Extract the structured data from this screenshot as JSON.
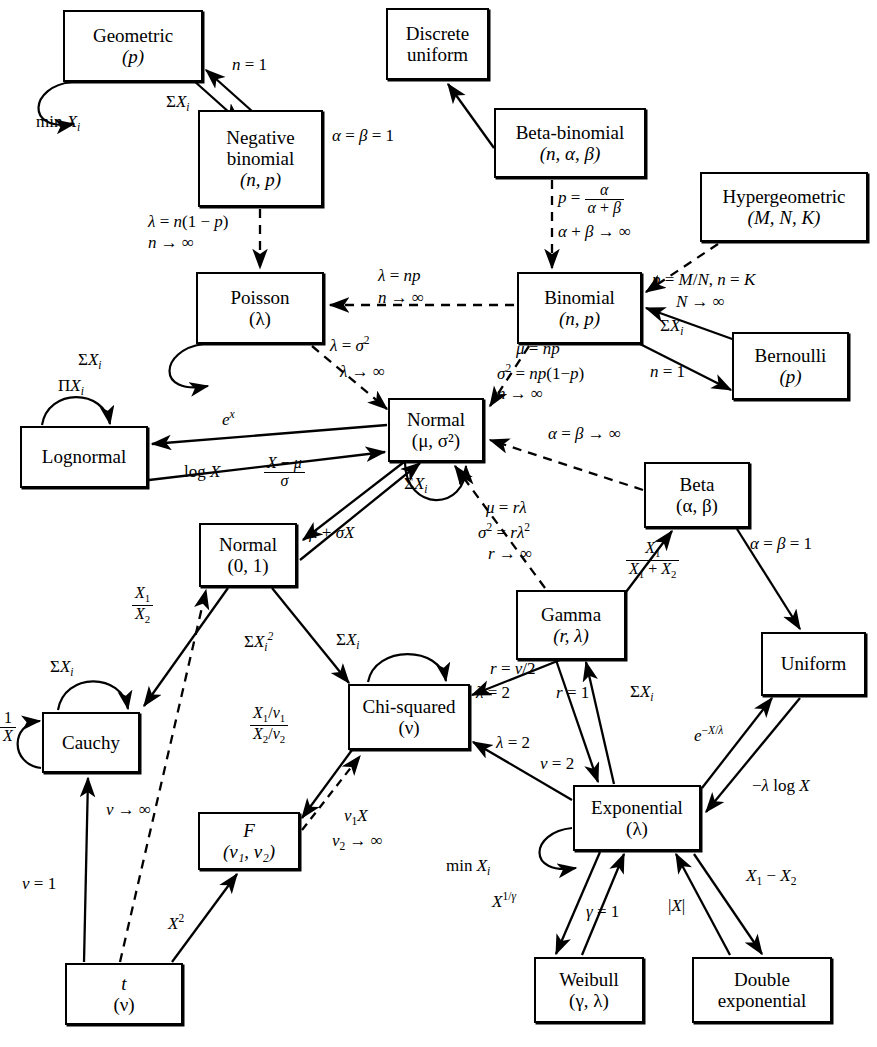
{
  "figure": {
    "type": "relationship-diagram",
    "legend": {
      "solid_arrow": "exact transformation / special case",
      "dashed_arrow": "limiting (asymptotic) relationship"
    }
  },
  "nodes": [
    {
      "id": "geometric",
      "name": "Geometric",
      "params": "(p)",
      "x": 63,
      "y": 10,
      "w": 140,
      "h": 72
    },
    {
      "id": "negative-binomial",
      "name": "Negative",
      "name2": "binomial",
      "params": "(n, p)",
      "x": 198,
      "y": 110,
      "w": 125,
      "h": 97
    },
    {
      "id": "discrete-uniform",
      "name": "Discrete",
      "name2": "uniform",
      "params": "",
      "x": 386,
      "y": 8,
      "w": 103,
      "h": 72
    },
    {
      "id": "beta-binomial",
      "name": "Beta-binomial",
      "params": "(n, α, β)",
      "x": 494,
      "y": 108,
      "w": 152,
      "h": 70
    },
    {
      "id": "hypergeometric",
      "name": "Hypergeometric",
      "params": "(M, N, K)",
      "x": 700,
      "y": 172,
      "w": 168,
      "h": 70
    },
    {
      "id": "poisson",
      "name": "Poisson",
      "params": "(λ)",
      "x": 196,
      "y": 272,
      "w": 128,
      "h": 72
    },
    {
      "id": "binomial",
      "name": "Binomial",
      "params": "(n, p)",
      "x": 517,
      "y": 272,
      "w": 125,
      "h": 72
    },
    {
      "id": "bernoulli",
      "name": "Bernoulli",
      "params": "(p)",
      "x": 732,
      "y": 332,
      "w": 117,
      "h": 68
    },
    {
      "id": "normal-mu-sigma",
      "name": "Normal",
      "params": "(μ, σ²)",
      "x": 388,
      "y": 398,
      "w": 96,
      "h": 64
    },
    {
      "id": "lognormal",
      "name": "Lognormal",
      "params": "",
      "x": 20,
      "y": 426,
      "w": 128,
      "h": 62
    },
    {
      "id": "normal-01",
      "name": "Normal",
      "params": "(0, 1)",
      "x": 199,
      "y": 523,
      "w": 98,
      "h": 64
    },
    {
      "id": "beta",
      "name": "Beta",
      "params": "(α, β)",
      "x": 644,
      "y": 462,
      "w": 106,
      "h": 66
    },
    {
      "id": "gamma",
      "name": "Gamma",
      "params": "(r, λ)",
      "x": 516,
      "y": 590,
      "w": 110,
      "h": 70
    },
    {
      "id": "uniform",
      "name": "Uniform",
      "params": "",
      "x": 761,
      "y": 632,
      "w": 105,
      "h": 64
    },
    {
      "id": "cauchy",
      "name": "Cauchy",
      "params": "",
      "x": 42,
      "y": 712,
      "w": 98,
      "h": 61
    },
    {
      "id": "chi-squared",
      "name": "Chi-squared",
      "params": "(ν)",
      "x": 348,
      "y": 684,
      "w": 122,
      "h": 66
    },
    {
      "id": "exponential",
      "name": "Exponential",
      "params": "(λ)",
      "x": 573,
      "y": 785,
      "w": 128,
      "h": 66
    },
    {
      "id": "f",
      "name": "F",
      "params": "(ν₁, ν₂)",
      "x": 198,
      "y": 812,
      "w": 102,
      "h": 58
    },
    {
      "id": "t",
      "name": "t",
      "params": "(ν)",
      "x": 65,
      "y": 963,
      "w": 118,
      "h": 62
    },
    {
      "id": "weibull",
      "name": "Weibull",
      "params": "(γ, λ)",
      "x": 534,
      "y": 957,
      "w": 110,
      "h": 66
    },
    {
      "id": "double-exponential",
      "name": "Double",
      "name2": "exponential",
      "params": "",
      "x": 692,
      "y": 957,
      "w": 140,
      "h": 66
    }
  ],
  "edge_labels": [
    {
      "id": "geom-self",
      "text": "min X",
      "sub": "i",
      "x": 36,
      "y": 112
    },
    {
      "id": "nb-to-geom",
      "text": "n = 1",
      "x": 232,
      "y": 62
    },
    {
      "id": "geom-to-nb",
      "text": "ΣX",
      "sub": "i",
      "x": 168,
      "y": 98
    },
    {
      "id": "betabin-to-du",
      "text": "α = β = 1",
      "x": 339,
      "y": 126
    },
    {
      "id": "nb-to-poisson-1",
      "text": "λ = n(1 − p)",
      "x": 152,
      "y": 219
    },
    {
      "id": "nb-to-poisson-2",
      "text": "n → ∞",
      "x": 152,
      "y": 240
    },
    {
      "id": "betabin-to-binom-1",
      "text": "p = α/(α+β)",
      "x": 561,
      "y": 188
    },
    {
      "id": "betabin-to-binom-2",
      "text": "α + β → ∞",
      "x": 555,
      "y": 228
    },
    {
      "id": "hyper-to-binom-1",
      "text": "p = M/N, n = K",
      "x": 654,
      "y": 276
    },
    {
      "id": "hyper-to-binom-2",
      "text": "N → ∞",
      "x": 676,
      "y": 298
    },
    {
      "id": "binom-to-poisson-1",
      "text": "λ = np",
      "x": 380,
      "y": 273
    },
    {
      "id": "binom-to-poisson-2",
      "text": "n → ∞",
      "x": 378,
      "y": 294
    },
    {
      "id": "poisson-self",
      "text": "ΣX",
      "sub": "i",
      "x": 79,
      "y": 352
    },
    {
      "id": "poisson-to-normal-1",
      "text": "λ = σ²",
      "x": 335,
      "y": 341
    },
    {
      "id": "poisson-to-normal-2",
      "text": "λ → ∞",
      "x": 343,
      "y": 369
    },
    {
      "id": "binom-to-normal-1",
      "text": "μ = np",
      "x": 519,
      "y": 345
    },
    {
      "id": "binom-to-normal-2",
      "text": "σ² = np(1 − p)",
      "x": 500,
      "y": 369
    },
    {
      "id": "binom-to-normal-3",
      "text": "n → ∞",
      "x": 500,
      "y": 391
    },
    {
      "id": "bernoulli-to-binom",
      "text": "ΣX",
      "sub": "i",
      "x": 662,
      "y": 323
    },
    {
      "id": "binom-to-bernoulli",
      "text": "n = 1",
      "x": 653,
      "y": 368
    },
    {
      "id": "lognormal-self",
      "text": "ΠX",
      "sub": "i",
      "x": 60,
      "y": 379
    },
    {
      "id": "normal-to-lognormal",
      "text": "eˣ",
      "x": 226,
      "y": 416
    },
    {
      "id": "lognormal-to-normal",
      "text": "log X",
      "x": 188,
      "y": 468
    },
    {
      "id": "normal-to-n01",
      "text": "(X − μ)/σ",
      "x": 272,
      "y": 466
    },
    {
      "id": "n01-to-normal",
      "text": "μ + σX",
      "x": 313,
      "y": 530
    },
    {
      "id": "normal-self",
      "text": "ΣX",
      "sub": "i",
      "x": 406,
      "y": 481
    },
    {
      "id": "beta-to-normal",
      "text": "α = β → ∞",
      "x": 552,
      "y": 430
    },
    {
      "id": "gamma-to-normal-1",
      "text": "μ = rλ",
      "x": 488,
      "y": 505
    },
    {
      "id": "gamma-to-normal-2",
      "text": "σ² = rλ²",
      "x": 482,
      "y": 528
    },
    {
      "id": "gamma-to-normal-3",
      "text": "r → ∞",
      "x": 490,
      "y": 550
    },
    {
      "id": "gamma-to-beta",
      "text": "X₁/(X₁ + X₂)",
      "x": 630,
      "y": 550
    },
    {
      "id": "beta-to-uniform",
      "text": "α = β = 1",
      "x": 757,
      "y": 540
    },
    {
      "id": "n01-to-cauchy",
      "text": "X₁/X₂",
      "x": 135,
      "y": 592
    },
    {
      "id": "cauchy-self-top",
      "text": "ΣX",
      "sub": "i",
      "x": 52,
      "y": 663
    },
    {
      "id": "cauchy-self-left",
      "text": "1/X",
      "x": 0,
      "y": 718
    },
    {
      "id": "n01-to-chisq",
      "text": "ΣX²",
      "sub": "i",
      "x": 249,
      "y": 636
    },
    {
      "id": "chisq-self",
      "text": "ΣX",
      "sub": "i",
      "x": 338,
      "y": 636
    },
    {
      "id": "chisq-to-f",
      "text": "(X₁/ν₁)/(X₂/ν₂)",
      "x": 257,
      "y": 718
    },
    {
      "id": "f-to-chisq-1",
      "text": "ν₁X",
      "x": 348,
      "y": 813
    },
    {
      "id": "f-to-chisq-2",
      "text": "ν₂ → ∞",
      "x": 337,
      "y": 838
    },
    {
      "id": "chisq-to-gamma-1",
      "text": "r = ν/2",
      "x": 495,
      "y": 665
    },
    {
      "id": "chisq-to-gamma-2",
      "text": "λ = 2",
      "x": 481,
      "y": 690
    },
    {
      "id": "gamma-to-exp",
      "text": "r = 1",
      "x": 561,
      "y": 690
    },
    {
      "id": "exp-to-gamma",
      "text": "ΣX",
      "sub": "i",
      "x": 634,
      "y": 689
    },
    {
      "id": "chisq-to-exp-1",
      "text": "λ = 2",
      "x": 500,
      "y": 740
    },
    {
      "id": "chisq-to-exp-2",
      "text": "ν = 2",
      "x": 545,
      "y": 760
    },
    {
      "id": "exp-to-uniform",
      "text": "e⁻ˣᐟλ",
      "x": 700,
      "y": 732
    },
    {
      "id": "uniform-to-exp",
      "text": "−λ log X",
      "x": 758,
      "y": 783
    },
    {
      "id": "exp-self",
      "text": "min X",
      "sub": "i",
      "x": 449,
      "y": 862
    },
    {
      "id": "exp-to-weibull",
      "text": "X¹ᐟᵞ",
      "x": 497,
      "y": 898
    },
    {
      "id": "weibull-to-exp",
      "text": "γ = 1",
      "x": 592,
      "y": 908
    },
    {
      "id": "de-to-exp",
      "text": "|X|",
      "x": 672,
      "y": 902
    },
    {
      "id": "exp-to-de",
      "text": "X₁ − X₂",
      "x": 752,
      "y": 872
    },
    {
      "id": "t-to-cauchy",
      "text": "ν = 1",
      "x": 25,
      "y": 880
    },
    {
      "id": "t-to-n01",
      "text": "ν → ∞",
      "x": 110,
      "y": 806
    },
    {
      "id": "t-to-f",
      "text": "X²",
      "x": 172,
      "y": 920
    }
  ],
  "edges": [
    {
      "from": "negative-binomial",
      "to": "geometric",
      "style": "solid",
      "label": "n = 1"
    },
    {
      "from": "geometric",
      "to": "negative-binomial",
      "style": "solid",
      "label": "ΣX_i"
    },
    {
      "from": "geometric",
      "to": "geometric",
      "style": "solid",
      "label": "min X_i"
    },
    {
      "from": "beta-binomial",
      "to": "discrete-uniform",
      "style": "solid",
      "label": "α = β = 1"
    },
    {
      "from": "negative-binomial",
      "to": "poisson",
      "style": "dashed",
      "label": "λ = n(1 − p), n → ∞"
    },
    {
      "from": "beta-binomial",
      "to": "binomial",
      "style": "dashed",
      "label": "p = α/(α+β), α + β → ∞"
    },
    {
      "from": "hypergeometric",
      "to": "binomial",
      "style": "dashed",
      "label": "p = M/N, n = K, N → ∞"
    },
    {
      "from": "binomial",
      "to": "poisson",
      "style": "dashed",
      "label": "λ = np, n → ∞"
    },
    {
      "from": "poisson",
      "to": "poisson",
      "style": "solid",
      "label": "ΣX_i"
    },
    {
      "from": "poisson",
      "to": "normal-mu-sigma",
      "style": "dashed",
      "label": "λ = σ², λ → ∞"
    },
    {
      "from": "binomial",
      "to": "normal-mu-sigma",
      "style": "dashed",
      "label": "μ = np, σ² = np(1−p), n → ∞"
    },
    {
      "from": "bernoulli",
      "to": "binomial",
      "style": "solid",
      "label": "ΣX_i"
    },
    {
      "from": "binomial",
      "to": "bernoulli",
      "style": "solid",
      "label": "n = 1"
    },
    {
      "from": "lognormal",
      "to": "lognormal",
      "style": "solid",
      "label": "ΠX_i"
    },
    {
      "from": "normal-mu-sigma",
      "to": "lognormal",
      "style": "solid",
      "label": "eˣ"
    },
    {
      "from": "lognormal",
      "to": "normal-mu-sigma",
      "style": "solid",
      "label": "log X"
    },
    {
      "from": "normal-mu-sigma",
      "to": "normal-01",
      "style": "solid",
      "label": "(X − μ)/σ"
    },
    {
      "from": "normal-01",
      "to": "normal-mu-sigma",
      "style": "solid",
      "label": "μ + σX"
    },
    {
      "from": "normal-mu-sigma",
      "to": "normal-mu-sigma",
      "style": "solid",
      "label": "ΣX_i"
    },
    {
      "from": "beta",
      "to": "normal-mu-sigma",
      "style": "dashed",
      "label": "α = β → ∞"
    },
    {
      "from": "gamma",
      "to": "normal-mu-sigma",
      "style": "dashed",
      "label": "μ = rλ, σ² = rλ², r → ∞"
    },
    {
      "from": "gamma",
      "to": "beta",
      "style": "solid",
      "label": "X₁/(X₁+X₂)"
    },
    {
      "from": "beta",
      "to": "uniform",
      "style": "solid",
      "label": "α = β = 1"
    },
    {
      "from": "normal-01",
      "to": "cauchy",
      "style": "solid",
      "label": "X₁/X₂"
    },
    {
      "from": "cauchy",
      "to": "cauchy",
      "style": "solid",
      "label": "ΣX_i"
    },
    {
      "from": "cauchy",
      "to": "cauchy",
      "style": "solid",
      "label": "1/X"
    },
    {
      "from": "normal-01",
      "to": "chi-squared",
      "style": "solid",
      "label": "ΣX²_i"
    },
    {
      "from": "chi-squared",
      "to": "chi-squared",
      "style": "solid",
      "label": "ΣX_i"
    },
    {
      "from": "chi-squared",
      "to": "f",
      "style": "solid",
      "label": "(X₁/ν₁)/(X₂/ν₂)"
    },
    {
      "from": "f",
      "to": "chi-squared",
      "style": "dashed",
      "label": "ν₁X, ν₂ → ∞"
    },
    {
      "from": "chi-squared",
      "to": "gamma",
      "style": "solid",
      "label": "r = ν/2, λ = 2"
    },
    {
      "from": "gamma",
      "to": "exponential",
      "style": "solid",
      "label": "r = 1"
    },
    {
      "from": "exponential",
      "to": "gamma",
      "style": "solid",
      "label": "ΣX_i"
    },
    {
      "from": "exponential",
      "to": "chi-squared",
      "style": "solid",
      "label": "λ = 2, ν = 2"
    },
    {
      "from": "exponential",
      "to": "uniform",
      "style": "solid",
      "label": "e⁻Xᐟλ"
    },
    {
      "from": "uniform",
      "to": "exponential",
      "style": "solid",
      "label": "−λ log X"
    },
    {
      "from": "exponential",
      "to": "exponential",
      "style": "solid",
      "label": "min X_i"
    },
    {
      "from": "exponential",
      "to": "weibull",
      "style": "solid",
      "label": "X¹ᐟγ"
    },
    {
      "from": "weibull",
      "to": "exponential",
      "style": "solid",
      "label": "γ = 1"
    },
    {
      "from": "double-exponential",
      "to": "exponential",
      "style": "solid",
      "label": "|X|"
    },
    {
      "from": "exponential",
      "to": "double-exponential",
      "style": "solid",
      "label": "X₁ − X₂"
    },
    {
      "from": "t",
      "to": "cauchy",
      "style": "solid",
      "label": "ν = 1"
    },
    {
      "from": "t",
      "to": "normal-01",
      "style": "dashed",
      "label": "ν → ∞"
    },
    {
      "from": "t",
      "to": "f",
      "style": "solid",
      "label": "X²"
    }
  ]
}
